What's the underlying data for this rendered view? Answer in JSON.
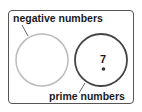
{
  "diagram": {
    "type": "venn",
    "sets": [
      {
        "id": "negative",
        "label": "negative numbers",
        "stroke_color": "#bbbbbb",
        "elements": []
      },
      {
        "id": "prime",
        "label": "prime numbers",
        "stroke_color": "#444444",
        "elements": [
          "7"
        ]
      }
    ],
    "elements": [
      {
        "value": "7",
        "set": "prime"
      }
    ]
  }
}
